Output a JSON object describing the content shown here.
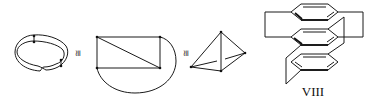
{
  "figure": {
    "panels": [
      {
        "id": "twisted-band",
        "kind": "twisted band (Möbius-like) with marked vertices"
      },
      {
        "id": "congruent-1",
        "symbol": "≅"
      },
      {
        "id": "rectangle-graph",
        "kind": "rectangle with diagonal and outer arc"
      },
      {
        "id": "congruent-2",
        "symbol": "≅"
      },
      {
        "id": "tetrahedron",
        "kind": "tetrahedral graph K4"
      },
      {
        "id": "stacked-rings",
        "kind": "triple-decker bridged aromatic rings",
        "label": "VIII"
      }
    ]
  },
  "symbols": {
    "congruent": "≅"
  },
  "labels": {
    "compound": "VIII"
  }
}
